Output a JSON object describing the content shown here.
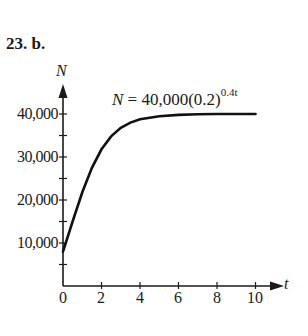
{
  "heading": "23. b.",
  "chart_data": {
    "type": "line",
    "title": "",
    "equation": {
      "lhs": "N",
      "base": "40,000(0.2)",
      "exponent": "0.4t"
    },
    "xlabel": "t",
    "ylabel": "N",
    "x_ticks": [
      "0",
      "2",
      "4",
      "6",
      "8",
      "10"
    ],
    "y_ticks": [
      "10,000",
      "20,000",
      "30,000",
      "40,000"
    ],
    "xlim": [
      0,
      10.5
    ],
    "ylim": [
      0,
      42000
    ],
    "grid": false,
    "legend": null,
    "series": [
      {
        "name": "N = 40,000(0.2)^(0.4^t)",
        "x": [
          0,
          0.5,
          1,
          1.5,
          2,
          2.5,
          3,
          3.5,
          4,
          5,
          6,
          7,
          8,
          9,
          10
        ],
        "values": [
          8000,
          15000,
          21800,
          27500,
          31800,
          34800,
          36800,
          38000,
          38800,
          39500,
          39800,
          39950,
          40000,
          40000,
          40000
        ]
      }
    ]
  }
}
